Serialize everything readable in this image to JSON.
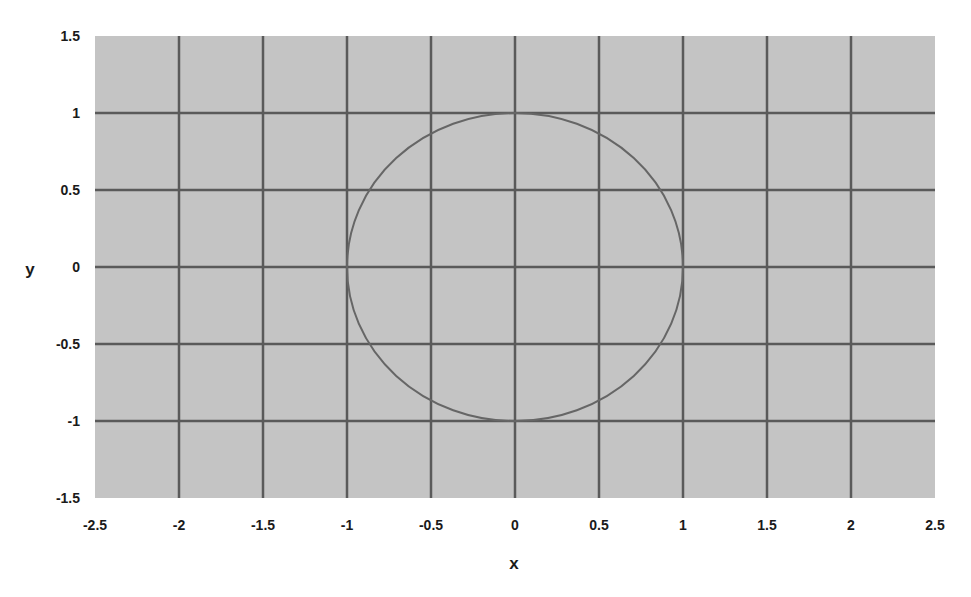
{
  "chart_data": {
    "type": "line",
    "title": "",
    "xlabel": "x",
    "ylabel": "y",
    "xlim": [
      -2.5,
      2.5
    ],
    "ylim": [
      -1.5,
      1.5
    ],
    "x_ticks": [
      -2.5,
      -2,
      -1.5,
      -1,
      -0.5,
      0,
      0.5,
      1,
      1.5,
      2,
      2.5
    ],
    "x_tick_labels": [
      "-2.5",
      "-2",
      "-1.5",
      "-1",
      "-0.5",
      "0",
      "0.5",
      "1",
      "1.5",
      "2",
      "2.5"
    ],
    "y_ticks": [
      1.5,
      1,
      0.5,
      0,
      -0.5,
      -1,
      -1.5
    ],
    "y_tick_labels": [
      "1.5",
      "1",
      "0.5",
      "0",
      "-0.5",
      "-1",
      "-1.5"
    ],
    "grid": true,
    "legend": null,
    "series": [
      {
        "name": "unit circle x^2 + y^2 = 1",
        "shape": "circle",
        "center": [
          0,
          0
        ],
        "radius": 1,
        "points": [
          [
            1,
            0
          ],
          [
            0.866,
            0.5
          ],
          [
            0.5,
            0.866
          ],
          [
            0,
            1
          ],
          [
            -0.5,
            0.866
          ],
          [
            -0.866,
            0.5
          ],
          [
            -1,
            0
          ],
          [
            -0.866,
            -0.5
          ],
          [
            -0.5,
            -0.866
          ],
          [
            0,
            -1
          ],
          [
            0.5,
            -0.866
          ],
          [
            0.866,
            -0.5
          ],
          [
            1,
            0
          ]
        ]
      }
    ]
  },
  "colors": {
    "plot_background": "#c4c4c4",
    "grid": "#5a5a5a",
    "curve": "#666666",
    "text": "#1a1a1a"
  }
}
